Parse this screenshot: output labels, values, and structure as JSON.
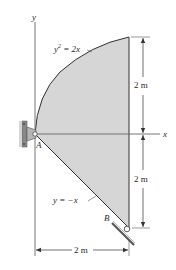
{
  "diagram": {
    "axes": {
      "x_label": "x",
      "y_label": "y"
    },
    "curves": {
      "upper": {
        "equation_lhs": "y",
        "exponent": "2",
        "equation_rhs": " = 2x"
      },
      "lower": {
        "equation": "y = −x"
      }
    },
    "points": {
      "A": "A",
      "B": "B"
    },
    "dimensions": {
      "upper_height": "2 m",
      "lower_height": "2 m",
      "width": "2 m"
    },
    "supports": {
      "A": "pin-support",
      "B": "roller-support"
    },
    "colors": {
      "shaded_region": "#d6d6d6",
      "lines": "#333333",
      "dimension_lines": "#444444",
      "axes": "#555555"
    }
  }
}
